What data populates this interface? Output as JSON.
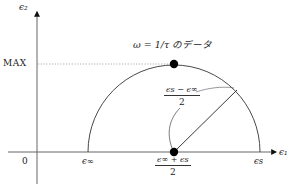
{
  "diagram": {
    "type": "cole-cole-plot",
    "axes": {
      "y_label": "ϵ₂",
      "x_label": "ϵ₁",
      "origin_label": "0",
      "max_label": "MAX"
    },
    "x_ticks": {
      "eps_inf": "ϵ∞",
      "eps_s": "ϵs",
      "center_numerator": "ϵ∞ + ϵs",
      "center_denominator": "2"
    },
    "annotations": {
      "peak_label": "ω = 1/τ のデータ",
      "radius_numerator": "ϵs − ϵ∞",
      "radius_denominator": "2"
    },
    "colors": {
      "axis": "#555555",
      "curve": "#333333",
      "dot": "#000000",
      "dotted": "#888888"
    }
  }
}
